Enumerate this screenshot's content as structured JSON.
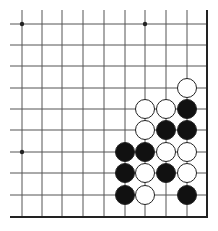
{
  "board": {
    "type": "go-board-corner",
    "view": "lower-right corner",
    "cols": [
      22,
      42,
      62,
      83,
      104,
      125,
      145,
      166,
      187,
      207
    ],
    "rows": [
      24,
      45,
      66,
      88,
      109,
      130,
      152,
      173,
      195,
      217
    ],
    "star_points": [
      [
        0,
        0
      ],
      [
        6,
        0
      ],
      [
        0,
        6
      ]
    ],
    "stone_radius": 9.5,
    "stones": [
      {
        "color": "white",
        "c": 8,
        "r": 3
      },
      {
        "color": "white",
        "c": 6,
        "r": 4
      },
      {
        "color": "white",
        "c": 7,
        "r": 4
      },
      {
        "color": "black",
        "c": 8,
        "r": 4
      },
      {
        "color": "white",
        "c": 6,
        "r": 5
      },
      {
        "color": "black",
        "c": 7,
        "r": 5
      },
      {
        "color": "black",
        "c": 8,
        "r": 5
      },
      {
        "color": "black",
        "c": 5,
        "r": 6
      },
      {
        "color": "black",
        "c": 6,
        "r": 6
      },
      {
        "color": "white",
        "c": 7,
        "r": 6
      },
      {
        "color": "white",
        "c": 8,
        "r": 6
      },
      {
        "color": "black",
        "c": 5,
        "r": 7
      },
      {
        "color": "white",
        "c": 6,
        "r": 7
      },
      {
        "color": "black",
        "c": 7,
        "r": 7
      },
      {
        "color": "white",
        "c": 8,
        "r": 7
      },
      {
        "color": "black",
        "c": 5,
        "r": 8
      },
      {
        "color": "white",
        "c": 6,
        "r": 8
      },
      {
        "color": "black",
        "c": 8,
        "r": 8
      }
    ],
    "colors": {
      "line": "#555555",
      "edge": "#222222",
      "black": "#111111",
      "white": "#ffffff"
    }
  }
}
